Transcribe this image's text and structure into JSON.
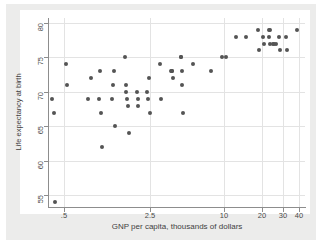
{
  "figure": {
    "background_color": "#ececeb",
    "plot_background_color": "#ffffff",
    "marker_color": "#545454",
    "axis_color": "#8d8d8d",
    "grid_color": "#e3e3e3"
  },
  "chart_data": {
    "type": "scatter",
    "title": "",
    "xlabel": "GNP per capita, thousands of dollars",
    "ylabel": "Life expectancy at birth",
    "xscale": "log",
    "yscale": "linear",
    "xticks": [
      0.5,
      2.5,
      10,
      20,
      30,
      40
    ],
    "xticklabels": [
      ".5",
      "2.5",
      "10",
      "20",
      "30",
      "40"
    ],
    "yticks": [
      55,
      60,
      65,
      70,
      75,
      80
    ],
    "yticklabels": [
      "55",
      "60",
      "65",
      "70",
      "75",
      "80"
    ],
    "xlim": [
      0.37,
      45
    ],
    "ylim": [
      53.3,
      80.7
    ],
    "grid": true,
    "legend": null,
    "points": [
      [
        0.4,
        69
      ],
      [
        0.41,
        67
      ],
      [
        0.42,
        54
      ],
      [
        0.52,
        74
      ],
      [
        0.53,
        71
      ],
      [
        0.78,
        69
      ],
      [
        0.82,
        72
      ],
      [
        0.95,
        69
      ],
      [
        0.98,
        73
      ],
      [
        1.0,
        67
      ],
      [
        1.02,
        62
      ],
      [
        1.22,
        69
      ],
      [
        1.25,
        71
      ],
      [
        1.28,
        73
      ],
      [
        1.3,
        65
      ],
      [
        1.55,
        75
      ],
      [
        1.58,
        71
      ],
      [
        1.6,
        70
      ],
      [
        1.62,
        69
      ],
      [
        1.65,
        68
      ],
      [
        1.68,
        64
      ],
      [
        1.95,
        70
      ],
      [
        1.98,
        69
      ],
      [
        2.0,
        68
      ],
      [
        2.35,
        70
      ],
      [
        2.4,
        69
      ],
      [
        2.45,
        72
      ],
      [
        2.48,
        67
      ],
      [
        3.0,
        74
      ],
      [
        3.05,
        69
      ],
      [
        3.7,
        73
      ],
      [
        3.75,
        73
      ],
      [
        3.78,
        73
      ],
      [
        3.8,
        72
      ],
      [
        4.4,
        75
      ],
      [
        4.45,
        75
      ],
      [
        4.5,
        73
      ],
      [
        4.55,
        71
      ],
      [
        4.6,
        67
      ],
      [
        5.6,
        74
      ],
      [
        7.7,
        73
      ],
      [
        9.6,
        75
      ],
      [
        10.2,
        75
      ],
      [
        12.5,
        78
      ],
      [
        14.8,
        78
      ],
      [
        18.8,
        79
      ],
      [
        19.2,
        76
      ],
      [
        20.5,
        78
      ],
      [
        21.0,
        77
      ],
      [
        22.8,
        78
      ],
      [
        23.0,
        79
      ],
      [
        23.2,
        79
      ],
      [
        23.4,
        77
      ],
      [
        24.6,
        77
      ],
      [
        25.4,
        77
      ],
      [
        26.2,
        77
      ],
      [
        27.5,
        78
      ],
      [
        28.0,
        76
      ],
      [
        31.5,
        78
      ],
      [
        32.0,
        76
      ],
      [
        38.5,
        79
      ]
    ]
  }
}
